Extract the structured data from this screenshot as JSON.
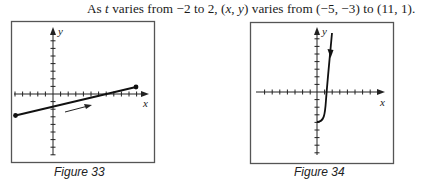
{
  "text": {
    "prefix": "As ",
    "var_t": "t",
    "part1": " varies from −2 to 2, (",
    "var_x": "x",
    "comma": ", ",
    "var_y": "y",
    "part2": ") varies from (−5, −3) to (11, 1)."
  },
  "figures": [
    {
      "caption": "Figure 33",
      "x_label": "x",
      "y_label": "y",
      "curve": "line segment from (-5,-3) to (11,1)",
      "start_point": [
        -5,
        -3
      ],
      "end_point": [
        11,
        1
      ],
      "direction_arrow": "left-to-right"
    },
    {
      "caption": "Figure 34",
      "x_label": "x",
      "y_label": "y",
      "curve": "curve rising from (0,-4) steeply upward",
      "start_point": [
        0,
        -4
      ],
      "direction_arrow": "downward"
    }
  ],
  "colors": {
    "ink": "#1a1a1a",
    "frame": "#555555"
  }
}
